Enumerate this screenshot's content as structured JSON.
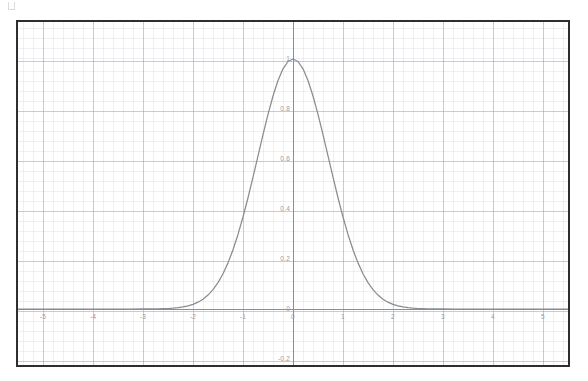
{
  "chart_data": {
    "type": "line",
    "title": "",
    "subtitle": "",
    "xlabel": "",
    "ylabel": "",
    "legend": [],
    "legend_position": "none",
    "grid": true,
    "grid_minor": true,
    "xlim": [
      -5.5,
      5.5
    ],
    "ylim": [
      -0.28,
      1.09
    ],
    "x_ticks": [
      "-5",
      "-4",
      "-3",
      "-2",
      "-1",
      "0",
      "1",
      "2",
      "3",
      "4",
      "5"
    ],
    "x_tick_values": [
      -5,
      -4,
      -3,
      -2,
      -1,
      0,
      1,
      2,
      3,
      4,
      5
    ],
    "y_ticks": [
      "1",
      "0.8",
      "0.6",
      "0.4",
      "0.2",
      "0",
      "-0.2"
    ],
    "y_tick_values": [
      1,
      0.8,
      0.6,
      0.4,
      0.2,
      0,
      -0.2
    ],
    "series": [
      {
        "name": "gaussian",
        "color": "#8b8b94",
        "x": [
          -5.5,
          -5.25,
          -5,
          -4.75,
          -4.5,
          -4.25,
          -4,
          -3.75,
          -3.5,
          -3.25,
          -3,
          -2.9,
          -2.8,
          -2.7,
          -2.6,
          -2.5,
          -2.4,
          -2.3,
          -2.2,
          -2.1,
          -2,
          -1.9,
          -1.8,
          -1.7,
          -1.6,
          -1.5,
          -1.4,
          -1.3,
          -1.2,
          -1.1,
          -1,
          -0.9,
          -0.8,
          -0.7,
          -0.6,
          -0.5,
          -0.4,
          -0.3,
          -0.2,
          -0.1,
          0,
          0.1,
          0.2,
          0.3,
          0.4,
          0.5,
          0.6,
          0.7,
          0.8,
          0.9,
          1,
          1.1,
          1.2,
          1.3,
          1.4,
          1.5,
          1.6,
          1.7,
          1.8,
          1.9,
          2,
          2.1,
          2.2,
          2.3,
          2.4,
          2.5,
          2.6,
          2.7,
          2.8,
          2.9,
          3,
          3.25,
          3.5,
          3.75,
          4,
          4.25,
          4.5,
          4.75,
          5,
          5.25,
          5.5
        ],
        "y": [
          0,
          0,
          0,
          0,
          0,
          0,
          0,
          0,
          0,
          0,
          0.0001,
          0.0002,
          0.0004,
          0.0007,
          0.0012,
          0.0019,
          0.0032,
          0.0052,
          0.0082,
          0.0127,
          0.0183,
          0.0273,
          0.0392,
          0.0556,
          0.0773,
          0.1054,
          0.1409,
          0.1845,
          0.2369,
          0.2982,
          0.3679,
          0.4449,
          0.5273,
          0.6126,
          0.6977,
          0.7788,
          0.8521,
          0.9139,
          0.9608,
          0.99,
          1,
          0.99,
          0.9608,
          0.9139,
          0.8521,
          0.7788,
          0.6977,
          0.6126,
          0.5273,
          0.4449,
          0.3679,
          0.2982,
          0.2369,
          0.1845,
          0.1409,
          0.1054,
          0.0773,
          0.0556,
          0.0392,
          0.0273,
          0.0183,
          0.0127,
          0.0082,
          0.0052,
          0.0032,
          0.0019,
          0.0012,
          0.0007,
          0.0004,
          0.0002,
          0.0001,
          0,
          0,
          0,
          0,
          0,
          0,
          0,
          0,
          0,
          0
        ]
      }
    ],
    "annotations": [],
    "colors": {
      "curve": "#8b8b94",
      "axis": "#8d8d9a",
      "grid_major": "#9696af",
      "grid_minor": "#a0a0be",
      "frame": "#2e2e2e",
      "tick_text": "#9a9aa6",
      "background": "#ffffff"
    }
  }
}
